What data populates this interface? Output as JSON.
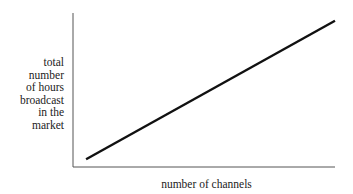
{
  "chart_data": {
    "type": "line",
    "title": "",
    "xlabel": "number of channels",
    "ylabel": "total number of hours broadcast in the market",
    "ylabel_lines": [
      "total",
      "number",
      "of hours",
      "broadcast",
      "in the",
      "market"
    ],
    "x_ticks": [],
    "y_ticks": [],
    "grid": false,
    "legend": null,
    "series": [
      {
        "name": "total hours broadcast",
        "x": [
          0.05,
          1.0
        ],
        "y": [
          0.05,
          0.95
        ],
        "color": "#111111"
      }
    ],
    "xlim": [
      0,
      1
    ],
    "ylim": [
      0,
      1
    ]
  }
}
